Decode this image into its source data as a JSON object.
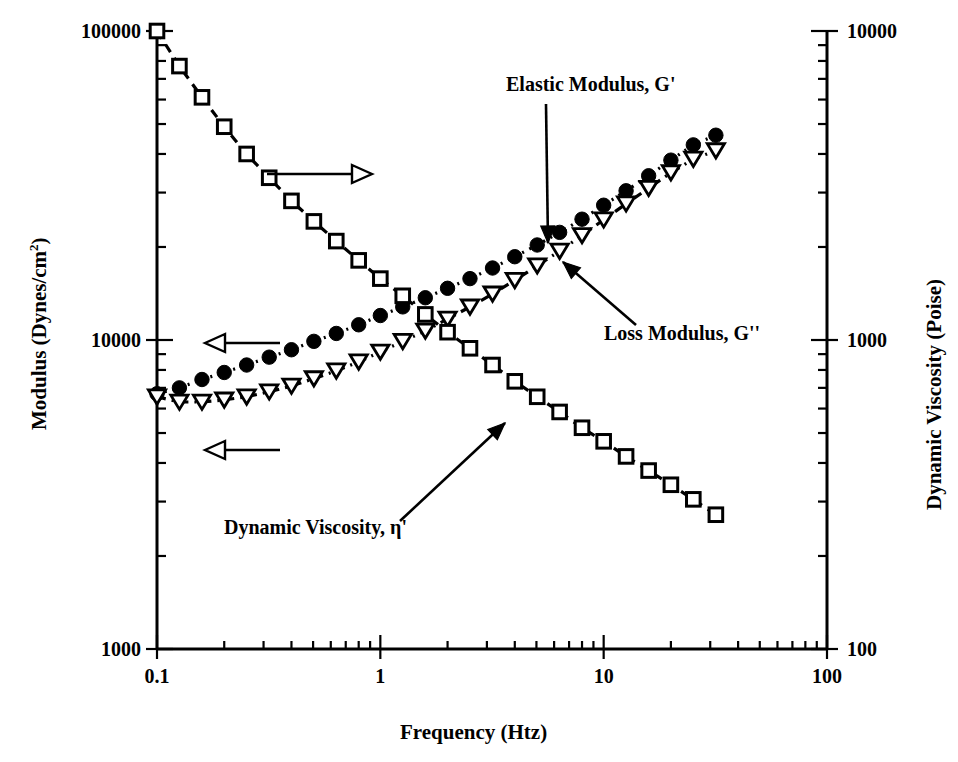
{
  "chart_data": {
    "type": "line",
    "title": "",
    "xlabel": "Frequency  (Htz)",
    "ylabel_left": "Modulus   (Dynes/cm2)",
    "ylabel_right": "Dynamic Viscosity  (Poise)",
    "xscale": "log",
    "yscale": "log",
    "xlim": [
      0.1,
      100
    ],
    "ylim_left": [
      1000,
      100000
    ],
    "ylim_right": [
      100,
      10000
    ],
    "grid": false,
    "legend": "inline-annotations",
    "xticks": [
      "0.1",
      "1",
      "10",
      "100"
    ],
    "xtick_values": [
      0.1,
      1,
      10,
      100
    ],
    "yticks_left": [
      "1000",
      "10000",
      "100000"
    ],
    "ytick_values_left": [
      1000,
      10000,
      100000
    ],
    "yticks_right": [
      "100",
      "1000",
      "10000"
    ],
    "ytick_values_right": [
      100,
      1000,
      10000
    ],
    "series": [
      {
        "name": "Elastic Modulus, G'",
        "marker": "filled-circle",
        "axis": "left",
        "linestyle": "dotted",
        "x": [
          0.1,
          0.126,
          0.159,
          0.2,
          0.252,
          0.318,
          0.4,
          0.504,
          0.635,
          0.8,
          1.0,
          1.26,
          1.59,
          2.0,
          2.52,
          3.18,
          4.0,
          5.04,
          6.35,
          8.0,
          10.0,
          12.6,
          15.9,
          20.0,
          25.2,
          31.8
        ],
        "y": [
          6700,
          7000,
          7450,
          7850,
          8300,
          8800,
          9300,
          9900,
          10500,
          11200,
          12000,
          12800,
          13700,
          14700,
          15800,
          17100,
          18600,
          20300,
          22300,
          24600,
          27300,
          30400,
          34000,
          38200,
          42800,
          46000
        ]
      },
      {
        "name": "Loss Modulus, G''",
        "marker": "open-triangle-down",
        "axis": "left",
        "linestyle": "dash-dot",
        "x": [
          0.1,
          0.126,
          0.159,
          0.2,
          0.252,
          0.318,
          0.4,
          0.504,
          0.635,
          0.8,
          1.0,
          1.26,
          1.59,
          2.0,
          2.52,
          3.18,
          4.0,
          5.04,
          6.35,
          8.0,
          10.0,
          12.6,
          15.9,
          20.0,
          25.2,
          31.8
        ],
        "y": [
          6550,
          6300,
          6300,
          6400,
          6550,
          6800,
          7100,
          7500,
          7950,
          8500,
          9150,
          9900,
          10700,
          11700,
          12800,
          14100,
          15600,
          17400,
          19400,
          21800,
          24500,
          27600,
          31000,
          34800,
          38500,
          41000
        ]
      },
      {
        "name": "Dynamic Viscosity, η'",
        "marker": "open-square",
        "axis": "right",
        "linestyle": "dashed",
        "x": [
          0.1,
          0.126,
          0.159,
          0.2,
          0.252,
          0.318,
          0.4,
          0.504,
          0.635,
          0.8,
          1.0,
          1.26,
          1.59,
          2.0,
          2.52,
          3.18,
          4.0,
          5.04,
          6.35,
          8.0,
          10.0,
          12.6,
          15.9,
          20.0,
          25.2,
          31.8
        ],
        "y": [
          10000,
          7700,
          6100,
          4900,
          4000,
          3350,
          2820,
          2420,
          2090,
          1810,
          1580,
          1390,
          1210,
          1060,
          940,
          830,
          735,
          655,
          585,
          520,
          470,
          420,
          378,
          340,
          305,
          272
        ]
      }
    ],
    "annotations": [
      {
        "name": "elastic-modulus-label",
        "text": "Elastic Modulus, G'",
        "x": 506,
        "y": 91,
        "arrow": {
          "x1": 546,
          "y1": 104,
          "x2": 548,
          "y2": 243
        }
      },
      {
        "name": "loss-modulus-label",
        "text": "Loss Modulus, G''",
        "x": 604,
        "y": 340,
        "arrow": {
          "x1": 636,
          "y1": 325,
          "x2": 563,
          "y2": 262
        }
      },
      {
        "name": "dynamic-viscosity-label",
        "text": "Dynamic Viscosity, η'",
        "x": 224,
        "y": 534,
        "arrow": {
          "x1": 400,
          "y1": 521,
          "x2": 505,
          "y2": 423
        }
      },
      {
        "name": "right-axis-pointer-arrow",
        "text": "",
        "arrow": {
          "x1": 267,
          "y1": 174,
          "x2": 372,
          "y2": 174
        }
      },
      {
        "name": "left-axis-pointer-arrow-upper",
        "text": "",
        "arrow": {
          "x1": 280,
          "y1": 343,
          "x2": 205,
          "y2": 343
        }
      },
      {
        "name": "left-axis-pointer-arrow-lower",
        "text": "",
        "arrow": {
          "x1": 280,
          "y1": 450,
          "x2": 205,
          "y2": 450
        }
      }
    ]
  },
  "axes": {
    "left_title_main": "Modulus   (Dynes/cm",
    "left_title_sup": "2",
    "left_title_end": ")",
    "right_title": "Dynamic Viscosity  (Poise)",
    "bottom_title": "Frequency  (Htz)"
  }
}
